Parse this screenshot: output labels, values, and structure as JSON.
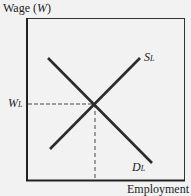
{
  "diagram": {
    "y_axis_label": "Wage",
    "y_axis_var": "W",
    "x_axis_label": "Employment",
    "curves": [
      {
        "name": "Supply",
        "label": "S",
        "subscript": "L"
      },
      {
        "name": "Demand",
        "label": "D",
        "subscript": "L"
      }
    ],
    "equilibrium_label": {
      "label": "W",
      "subscript": "L"
    },
    "colors": {
      "line": "#2b2b2b",
      "background": "#f2f2f2"
    }
  }
}
